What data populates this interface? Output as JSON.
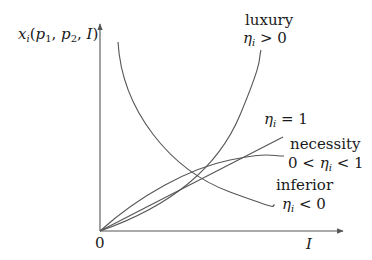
{
  "diagram": {
    "y_axis_label": "x_i(p_1, p_2, I)",
    "y_axis_label_parts": {
      "var": "x",
      "sub": "i",
      "args": [
        "p",
        "1",
        "p",
        "2",
        "I"
      ]
    },
    "x_axis_label": "I",
    "origin_label": "0",
    "curves": [
      {
        "id": "luxury",
        "name": "luxury",
        "condition": "η_i > 0",
        "cond_symbol": "η",
        "cond_sub": "i",
        "cond_rel": " > 0",
        "shape": "convex increasing from origin"
      },
      {
        "id": "unit",
        "name": "",
        "condition": "η_i = 1",
        "cond_symbol": "η",
        "cond_sub": "i",
        "cond_rel": " = 1",
        "shape": "straight line from origin"
      },
      {
        "id": "necessity",
        "name": "necessity",
        "condition": "0 < η_i < 1",
        "cond_prefix": "0 < ",
        "cond_symbol": "η",
        "cond_sub": "i",
        "cond_rel": " < 1",
        "shape": "concave increasing from origin"
      },
      {
        "id": "inferior",
        "name": "inferior",
        "condition": "η_i < 0",
        "cond_symbol": "η",
        "cond_sub": "i",
        "cond_rel": " < 0",
        "shape": "decreasing convex"
      }
    ],
    "colors": {
      "stroke": "#555555",
      "text": "#1a1a1a",
      "background": "#ffffff"
    }
  }
}
